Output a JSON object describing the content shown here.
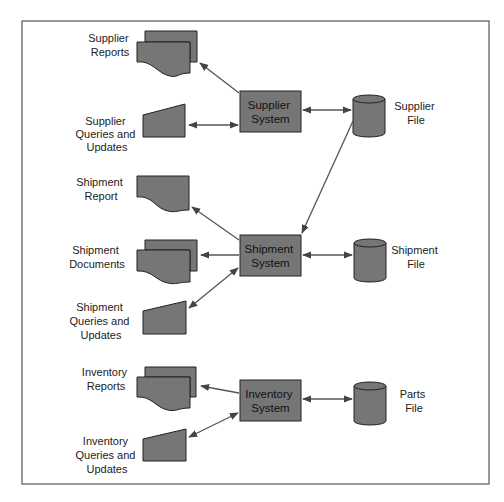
{
  "diagram": {
    "colors": {
      "shape_fill": "#767676",
      "stroke": "#222222",
      "line": "#555555",
      "background": "#ffffff"
    },
    "systems": [
      {
        "id": "supplier",
        "label_lines": [
          "Supplier",
          "System"
        ]
      },
      {
        "id": "shipment",
        "label_lines": [
          "Shipment",
          "System"
        ]
      },
      {
        "id": "inventory",
        "label_lines": [
          "Inventory",
          "System"
        ]
      }
    ],
    "files": [
      {
        "id": "supplier_file",
        "label_lines": [
          "Supplier",
          "File"
        ]
      },
      {
        "id": "shipment_file",
        "label_lines": [
          "Shipment",
          "File"
        ]
      },
      {
        "id": "parts_file",
        "label_lines": [
          "Parts",
          "File"
        ]
      }
    ],
    "outputs": [
      {
        "id": "supplier_reports",
        "label_lines": [
          "Supplier",
          "Reports"
        ],
        "type": "multi-document"
      },
      {
        "id": "supplier_queries",
        "label_lines": [
          "Supplier",
          "Queries and",
          "Updates"
        ],
        "type": "manual-input"
      },
      {
        "id": "shipment_report",
        "label_lines": [
          "Shipment",
          "Report"
        ],
        "type": "document"
      },
      {
        "id": "shipment_documents",
        "label_lines": [
          "Shipment",
          "Documents"
        ],
        "type": "multi-document"
      },
      {
        "id": "shipment_queries",
        "label_lines": [
          "Shipment",
          "Queries and",
          "Updates"
        ],
        "type": "manual-input"
      },
      {
        "id": "inventory_reports",
        "label_lines": [
          "Inventory",
          "Reports"
        ],
        "type": "multi-document"
      },
      {
        "id": "inventory_queries",
        "label_lines": [
          "Inventory",
          "Queries and",
          "Updates"
        ],
        "type": "manual-input"
      }
    ],
    "connections": [
      {
        "from": "supplier",
        "to": "supplier_reports",
        "direction": "one-way"
      },
      {
        "from": "supplier",
        "to": "supplier_queries",
        "direction": "two-way"
      },
      {
        "from": "supplier",
        "to": "supplier_file",
        "direction": "two-way"
      },
      {
        "from": "supplier_file",
        "to": "shipment",
        "direction": "one-way"
      },
      {
        "from": "shipment",
        "to": "shipment_report",
        "direction": "one-way"
      },
      {
        "from": "shipment",
        "to": "shipment_documents",
        "direction": "one-way"
      },
      {
        "from": "shipment",
        "to": "shipment_queries",
        "direction": "two-way"
      },
      {
        "from": "shipment",
        "to": "shipment_file",
        "direction": "two-way"
      },
      {
        "from": "inventory",
        "to": "inventory_reports",
        "direction": "one-way"
      },
      {
        "from": "inventory",
        "to": "inventory_queries",
        "direction": "two-way"
      },
      {
        "from": "inventory",
        "to": "parts_file",
        "direction": "two-way"
      }
    ]
  }
}
